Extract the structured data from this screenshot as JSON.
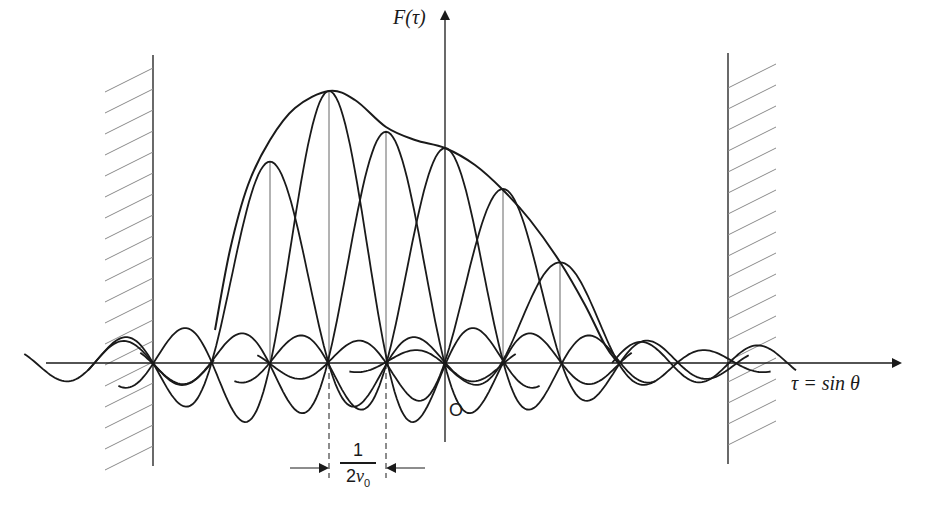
{
  "figure": {
    "y_axis_label": "F(τ)",
    "x_axis_label": "τ = sin θ",
    "origin_label": "O",
    "spacing_label": {
      "numerator": "1",
      "denominator_prefix": "2",
      "denominator_var": "ν",
      "denominator_sub": "0"
    },
    "colors": {
      "ink": "#1a1a1a",
      "thin": "#555555",
      "hatch": "#8a8a8a",
      "background": "#ffffff"
    }
  },
  "chart_data": {
    "type": "line",
    "title": "",
    "xlabel": "τ = sin θ",
    "ylabel": "F(τ)",
    "grid": false,
    "legend": "none",
    "origin_x_px": 445,
    "baseline_y_px": 363,
    "beam_spacing_px": 58.5,
    "beam_spacing_label": "1/(2ν0)",
    "visible_region_walls_px": [
      153,
      728
    ],
    "component_beams": [
      {
        "index": -3,
        "center_px": 270,
        "peak_height": 0.74
      },
      {
        "index": -2,
        "center_px": 329,
        "peak_height": 1.0
      },
      {
        "index": -1,
        "center_px": 386,
        "peak_height": 0.85
      },
      {
        "index": 0,
        "center_px": 445,
        "peak_height": 0.79
      },
      {
        "index": 1,
        "center_px": 503,
        "peak_height": 0.64
      },
      {
        "index": 2,
        "center_px": 560,
        "peak_height": 0.37
      }
    ],
    "envelope_points_px": [
      [
        215,
        330
      ],
      [
        230,
        250
      ],
      [
        248,
        185
      ],
      [
        270,
        140
      ],
      [
        295,
        108
      ],
      [
        329,
        91
      ],
      [
        355,
        100
      ],
      [
        386,
        127
      ],
      [
        415,
        140
      ],
      [
        445,
        148
      ],
      [
        475,
        165
      ],
      [
        503,
        190
      ],
      [
        530,
        220
      ],
      [
        560,
        262
      ],
      [
        585,
        305
      ],
      [
        605,
        345
      ],
      [
        618,
        363
      ]
    ],
    "peak_height_scale_px": 272
  }
}
